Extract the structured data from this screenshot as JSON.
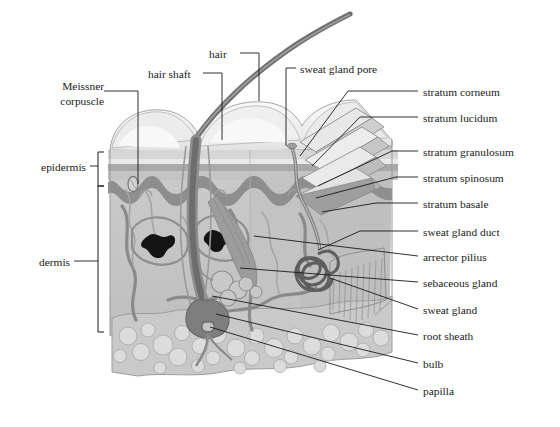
{
  "figure": {
    "type": "anatomical-diagram",
    "background": "#ffffff",
    "line_color": "#1a1a1a",
    "text_color": "#1a1a1a"
  },
  "labels_left": [
    {
      "id": "meissner-corpuscle",
      "line1": "Meissner",
      "line2": "corpuscle",
      "x": 57,
      "y": 86
    },
    {
      "id": "epidermis",
      "text": "epidermis",
      "x": 33,
      "y": 160
    },
    {
      "id": "dermis",
      "text": "dermis",
      "x": 30,
      "y": 255
    }
  ],
  "labels_top": [
    {
      "id": "hair-shaft",
      "text": "hair shaft",
      "x": 148,
      "y": 68
    },
    {
      "id": "hair",
      "text": "hair",
      "x": 209,
      "y": 48
    },
    {
      "id": "sweat-gland-pore",
      "text": "sweat gland pore",
      "x": 300,
      "y": 63
    }
  ],
  "labels_right": [
    {
      "id": "stratum-corneum",
      "text": "stratum corneum",
      "x": 423,
      "y": 86
    },
    {
      "id": "stratum-lucidum",
      "text": "stratum lucidum",
      "x": 423,
      "y": 112
    },
    {
      "id": "stratum-granulosum",
      "text": "stratum granulosum",
      "x": 423,
      "y": 146
    },
    {
      "id": "stratum-spinosum",
      "text": "stratum spinosum",
      "x": 423,
      "y": 172
    },
    {
      "id": "stratum-basale",
      "text": "stratum basale",
      "x": 423,
      "y": 198
    },
    {
      "id": "sweat-gland-duct",
      "text": "sweat gland duct",
      "x": 423,
      "y": 226
    },
    {
      "id": "arrector-pilius",
      "text": "arrector pilius",
      "x": 423,
      "y": 251
    },
    {
      "id": "sebaceous-gland",
      "text": "sebaceous gland",
      "x": 423,
      "y": 277
    },
    {
      "id": "sweat-gland",
      "text": "sweat gland",
      "x": 423,
      "y": 304
    },
    {
      "id": "root-sheath",
      "text": "root sheath",
      "x": 423,
      "y": 330
    },
    {
      "id": "bulb",
      "text": "bulb",
      "x": 423,
      "y": 358
    },
    {
      "id": "papilla",
      "text": "papilla",
      "x": 423,
      "y": 385
    }
  ],
  "brackets": [
    {
      "id": "epidermis-bracket",
      "from_y": 152,
      "to_y": 186
    },
    {
      "id": "dermis-bracket",
      "from_y": 186,
      "to_y": 332
    }
  ],
  "palette": {
    "surface_light": "#f2f2f2",
    "surface_shade": "#dcdcdc",
    "corneum": "#d4d4d4",
    "lucidum": "#e6e6e6",
    "granulosum": "#b9b9b9",
    "spinosum": "#c9c9c9",
    "basale": "#9a9a9a",
    "dermis": "#c3c3c3",
    "dermis_deep": "#b2b2b2",
    "hypodermis": "#c9c9c9",
    "fat_cell": "#d9d9d9",
    "vessel": "#8e8e8e",
    "vessel_dark": "#6f6f6f",
    "hair": "#7a7a7a",
    "hair_dark": "#4a4a4a",
    "gland": "#5e5e5e",
    "outline": "#8a8a8a"
  }
}
